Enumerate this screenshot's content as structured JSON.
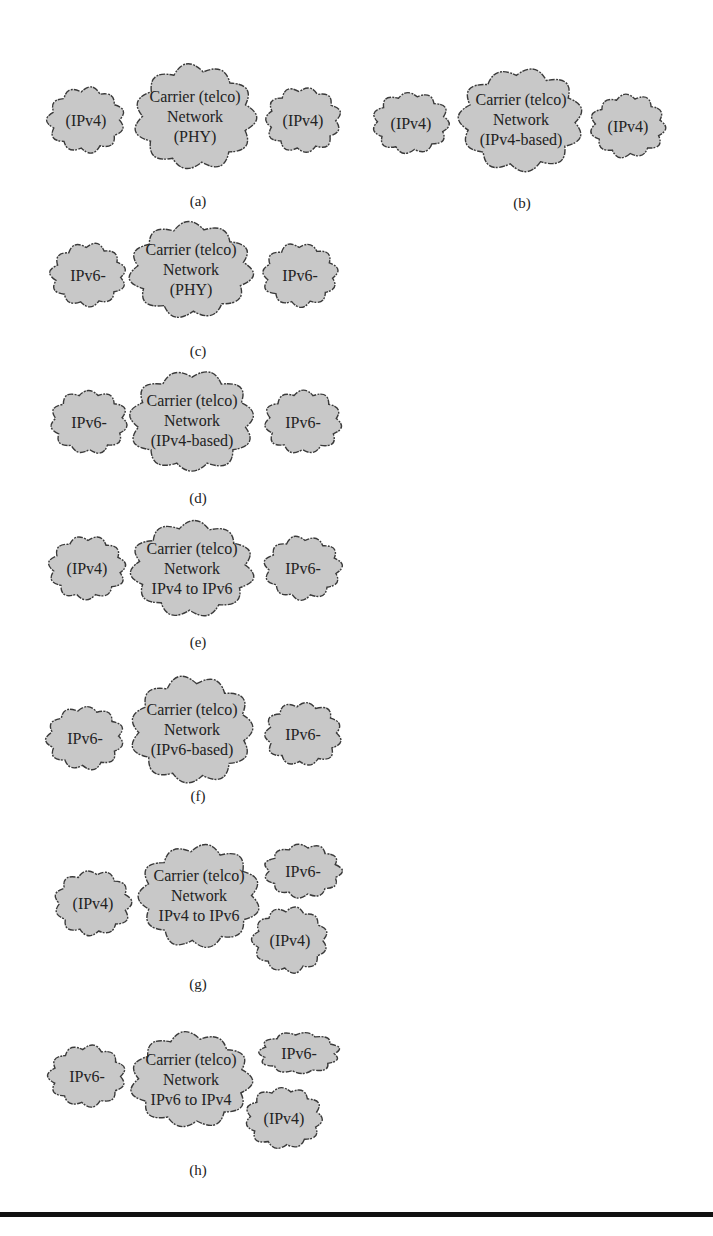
{
  "colors": {
    "cloud_fill": "#c8c8c8",
    "cloud_stroke": "#3a3a3a",
    "rule": "#111111"
  },
  "panels": [
    {
      "id": "a",
      "caption": "(a)",
      "clouds": [
        {
          "role": "left",
          "lines": [
            "(IPv4)"
          ],
          "x": 45,
          "y": 85,
          "w": 82,
          "h": 70
        },
        {
          "role": "center",
          "lines": [
            "Carrier (telco)",
            "Network",
            "(PHY)"
          ],
          "x": 132,
          "y": 62,
          "w": 126,
          "h": 110
        },
        {
          "role": "right",
          "lines": [
            "(IPv4)"
          ],
          "x": 263,
          "y": 85,
          "w": 80,
          "h": 70
        }
      ],
      "caption_x": 198,
      "caption_y": 193
    },
    {
      "id": "b",
      "caption": "(b)",
      "clouds": [
        {
          "role": "left",
          "lines": [
            "(IPv4)"
          ],
          "x": 370,
          "y": 90,
          "w": 82,
          "h": 66
        },
        {
          "role": "center",
          "lines": [
            "Carrier (telco)",
            "Network",
            "(IPv4-based)"
          ],
          "x": 456,
          "y": 66,
          "w": 130,
          "h": 108
        },
        {
          "role": "right",
          "lines": [
            "(IPv4)"
          ],
          "x": 588,
          "y": 92,
          "w": 80,
          "h": 68
        }
      ],
      "caption_x": 522,
      "caption_y": 195
    },
    {
      "id": "c",
      "caption": "(c)",
      "clouds": [
        {
          "role": "left",
          "lines": [
            "IPv6-"
          ],
          "x": 48,
          "y": 241,
          "w": 80,
          "h": 68
        },
        {
          "role": "center",
          "lines": [
            "Carrier (telco)",
            "Network",
            "(PHY)"
          ],
          "x": 127,
          "y": 220,
          "w": 128,
          "h": 100
        },
        {
          "role": "right",
          "lines": [
            "IPv6-"
          ],
          "x": 260,
          "y": 241,
          "w": 80,
          "h": 68
        }
      ],
      "caption_x": 198,
      "caption_y": 343
    },
    {
      "id": "d",
      "caption": "(d)",
      "clouds": [
        {
          "role": "left",
          "lines": [
            "IPv6-"
          ],
          "x": 48,
          "y": 388,
          "w": 82,
          "h": 68
        },
        {
          "role": "center",
          "lines": [
            "Carrier (telco)",
            "Network",
            "(IPv4-based)"
          ],
          "x": 127,
          "y": 368,
          "w": 130,
          "h": 106
        },
        {
          "role": "right",
          "lines": [
            "IPv6-"
          ],
          "x": 262,
          "y": 388,
          "w": 82,
          "h": 68
        }
      ],
      "caption_x": 198,
      "caption_y": 490
    },
    {
      "id": "e",
      "caption": "(e)",
      "clouds": [
        {
          "role": "left",
          "lines": [
            "(IPv4)"
          ],
          "x": 46,
          "y": 534,
          "w": 82,
          "h": 68
        },
        {
          "role": "center",
          "lines": [
            "Carrier (telco)",
            "Network",
            "IPv4 to IPv6"
          ],
          "x": 128,
          "y": 519,
          "w": 128,
          "h": 100
        },
        {
          "role": "right",
          "lines": [
            "IPv6-"
          ],
          "x": 262,
          "y": 534,
          "w": 82,
          "h": 68
        }
      ],
      "caption_x": 198,
      "caption_y": 634
    },
    {
      "id": "f",
      "caption": "(f)",
      "clouds": [
        {
          "role": "left",
          "lines": [
            "IPv6-"
          ],
          "x": 44,
          "y": 704,
          "w": 82,
          "h": 68
        },
        {
          "role": "center",
          "lines": [
            "Carrier (telco)",
            "Network",
            "(IPv6-based)"
          ],
          "x": 128,
          "y": 674,
          "w": 128,
          "h": 112
        },
        {
          "role": "right",
          "lines": [
            "IPv6-"
          ],
          "x": 262,
          "y": 700,
          "w": 82,
          "h": 68
        }
      ],
      "caption_x": 198,
      "caption_y": 788
    },
    {
      "id": "g",
      "caption": "(g)",
      "clouds": [
        {
          "role": "left",
          "lines": [
            "(IPv4)"
          ],
          "x": 52,
          "y": 868,
          "w": 82,
          "h": 70
        },
        {
          "role": "center",
          "lines": [
            "Carrier (telco)",
            "Network",
            "IPv4 to IPv6"
          ],
          "x": 136,
          "y": 842,
          "w": 126,
          "h": 108
        },
        {
          "role": "right-top",
          "lines": [
            "IPv6-"
          ],
          "x": 262,
          "y": 842,
          "w": 82,
          "h": 58
        },
        {
          "role": "right-bottom",
          "lines": [
            "(IPv4)"
          ],
          "x": 250,
          "y": 905,
          "w": 80,
          "h": 70
        }
      ],
      "caption_x": 198,
      "caption_y": 976
    },
    {
      "id": "h",
      "caption": "(h)",
      "clouds": [
        {
          "role": "left",
          "lines": [
            "IPv6-"
          ],
          "x": 46,
          "y": 1043,
          "w": 82,
          "h": 66
        },
        {
          "role": "center",
          "lines": [
            "Carrier (telco)",
            "Network",
            "IPv6 to IPv4"
          ],
          "x": 128,
          "y": 1030,
          "w": 126,
          "h": 100
        },
        {
          "role": "right-top",
          "lines": [
            "IPv6-"
          ],
          "x": 256,
          "y": 1030,
          "w": 86,
          "h": 46
        },
        {
          "role": "right-bottom",
          "lines": [
            "(IPv4)"
          ],
          "x": 243,
          "y": 1085,
          "w": 82,
          "h": 66
        }
      ],
      "caption_x": 198,
      "caption_y": 1162
    }
  ]
}
